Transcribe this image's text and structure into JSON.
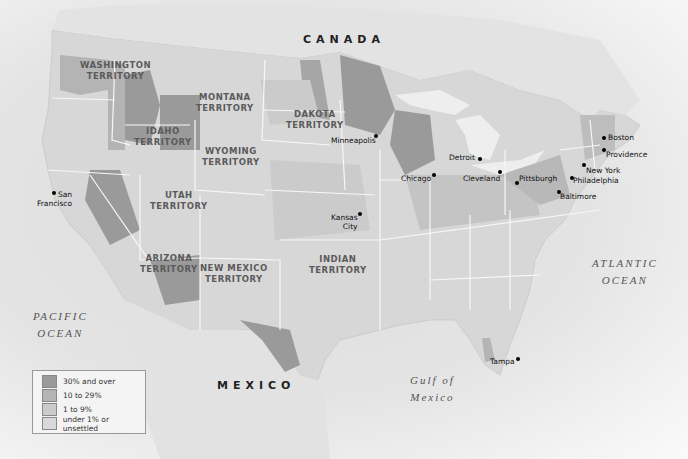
{
  "map": {
    "colors": {
      "over_30": "#9a9a9a",
      "ten_to_29": "#b4b4b4",
      "one_to_9": "#cbcbcb",
      "under_1": "#d9d9d9",
      "border": "#f7f7f7",
      "water": "#efefef"
    },
    "countries": {
      "canada": "CANADA",
      "mexico": "MEXICO"
    },
    "territories": {
      "washington": [
        "WASHINGTON",
        "TERRITORY"
      ],
      "montana": [
        "MONTANA",
        "TERRITORY"
      ],
      "dakota": [
        "DAKOTA",
        "TERRITORY"
      ],
      "idaho": [
        "IDAHO",
        "TERRITORY"
      ],
      "wyoming": [
        "WYOMING",
        "TERRITORY"
      ],
      "utah": [
        "UTAH",
        "TERRITORY"
      ],
      "arizona": [
        "ARIZONA",
        "TERRITORY"
      ],
      "new_mexico": [
        "NEW MEXICO",
        "TERRITORY"
      ],
      "indian": [
        "INDIAN",
        "TERRITORY"
      ]
    },
    "water_bodies": {
      "pacific": [
        "PACIFIC",
        "OCEAN"
      ],
      "atlantic": [
        "ATLANTIC",
        "OCEAN"
      ],
      "gulf": [
        "Gulf of",
        "Mexico"
      ]
    },
    "cities": [
      {
        "name": "Minneapolis",
        "lines": [
          "Minneapolis"
        ]
      },
      {
        "name": "Detroit",
        "lines": [
          "Detroit"
        ]
      },
      {
        "name": "Chicago",
        "lines": [
          "Chicago"
        ]
      },
      {
        "name": "Cleveland",
        "lines": [
          "Cleveland"
        ]
      },
      {
        "name": "Pittsburgh",
        "lines": [
          "Pittsburgh"
        ]
      },
      {
        "name": "Boston",
        "lines": [
          "Boston"
        ]
      },
      {
        "name": "Providence",
        "lines": [
          "Providence"
        ]
      },
      {
        "name": "New York",
        "lines": [
          "New York"
        ]
      },
      {
        "name": "Philadelphia",
        "lines": [
          "Philadelphia"
        ]
      },
      {
        "name": "Baltimore",
        "lines": [
          "Baltimore"
        ]
      },
      {
        "name": "San Francisco",
        "lines": [
          "San",
          "Francisco"
        ]
      },
      {
        "name": "Kansas City",
        "lines": [
          "Kansas",
          "City"
        ]
      },
      {
        "name": "Tampa",
        "lines": [
          "Tampa"
        ]
      }
    ],
    "legend": {
      "items": [
        {
          "label": "30% and over",
          "color": "#9a9a9a"
        },
        {
          "label": "10 to 29%",
          "color": "#b4b4b4"
        },
        {
          "label": "1 to 9%",
          "color": "#cbcbcb"
        },
        {
          "label": "under 1% or unsettled",
          "color": "#d9d9d9"
        }
      ]
    }
  }
}
